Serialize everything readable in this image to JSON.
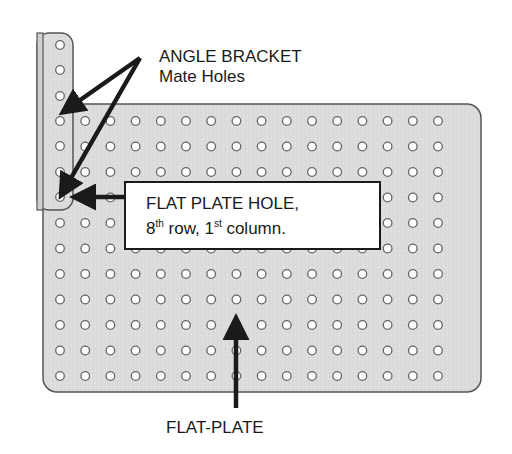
{
  "labels": {
    "angle_bracket_title": "ANGLE BRACKET",
    "angle_bracket_subtitle": "Mate Holes",
    "flat_plate": "FLAT-PLATE",
    "callout_line1": "FLAT PLATE HOLE,",
    "callout_row_num": "8",
    "callout_row_suffix": "th",
    "callout_row_word": " row, ",
    "callout_col_num": "1",
    "callout_col_suffix": "st",
    "callout_col_word": " column."
  },
  "colors": {
    "plate_fill": "#dcdcdc",
    "plate_stroke": "#555555",
    "hole_fill": "#ffffff",
    "hole_stroke": "#666666",
    "arrow": "#1a1a1a",
    "text": "#1a1a1a"
  },
  "flat_plate": {
    "rows": 11,
    "columns": 16,
    "x": 43,
    "y": 104,
    "width": 438,
    "height": 288,
    "corner_radius": 14,
    "hole_origin_x": 60,
    "hole_origin_y": 121,
    "hole_spacing_x": 25.2,
    "hole_spacing_y": 25.5,
    "hole_radius": 4.3
  },
  "angle_bracket": {
    "x": 37,
    "y": 33,
    "width": 36,
    "height": 177,
    "corner_radius": 12,
    "hole_x": 60,
    "hole_ys": [
      45,
      70,
      96,
      121,
      146,
      172,
      197
    ]
  },
  "highlighted_hole": {
    "row": 8,
    "column": 1
  },
  "arrows": [
    {
      "name": "angle-to-upper-mate-hole",
      "from": [
        140,
        58
      ],
      "to": [
        66,
        110
      ]
    },
    {
      "name": "angle-to-lower-mate-hole",
      "from": [
        140,
        58
      ],
      "to": [
        63,
        192
      ]
    },
    {
      "name": "callout-to-hole",
      "from": [
        130,
        197
      ],
      "to": [
        78,
        197
      ]
    },
    {
      "name": "flat-plate-label-to-plate",
      "from": [
        236,
        408
      ],
      "to": [
        236,
        322
      ]
    }
  ]
}
